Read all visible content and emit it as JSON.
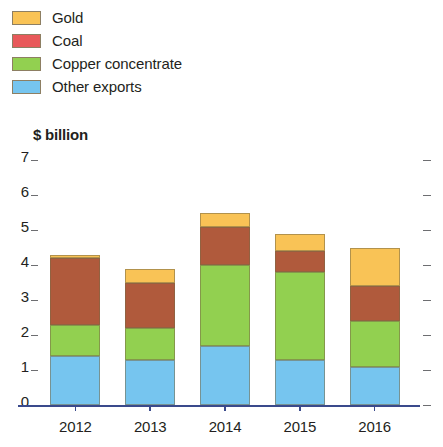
{
  "legend": {
    "items": [
      {
        "label": "Gold",
        "color": "#f9c356"
      },
      {
        "label": "Coal",
        "color": "#e8595a"
      },
      {
        "label": "Copper concentrate",
        "color": "#92d050"
      },
      {
        "label": "Other exports",
        "color": "#76c5ef"
      }
    ]
  },
  "axis": {
    "unit_caption": "$ billion",
    "y_ticks": [
      "7",
      "6",
      "5",
      "4",
      "3",
      "2",
      "1",
      "0"
    ]
  },
  "chart_data": {
    "type": "bar",
    "stacked": true,
    "title": "",
    "subtitle": "",
    "xlabel": "",
    "ylabel": "$ billion",
    "ylim": [
      0,
      7
    ],
    "yticks": [
      0,
      1,
      2,
      3,
      4,
      5,
      6,
      7
    ],
    "grid": false,
    "legend_position": "top-left",
    "categories": [
      "2012",
      "2013",
      "2014",
      "2015",
      "2016"
    ],
    "series": [
      {
        "name": "Other exports",
        "color": "#76c5ef",
        "values": [
          1.4,
          1.3,
          1.7,
          1.3,
          1.1
        ]
      },
      {
        "name": "Copper concentrate",
        "color": "#92d050",
        "values": [
          0.9,
          0.9,
          2.3,
          2.5,
          1.3
        ]
      },
      {
        "name": "Coal",
        "color": "#b05a3c",
        "values": [
          1.9,
          1.3,
          1.1,
          0.6,
          1.0
        ]
      },
      {
        "name": "Gold",
        "color": "#f9c356",
        "values": [
          0.1,
          0.4,
          0.4,
          0.5,
          1.1
        ]
      }
    ],
    "totals": [
      4.3,
      3.9,
      5.5,
      4.9,
      4.5
    ]
  }
}
